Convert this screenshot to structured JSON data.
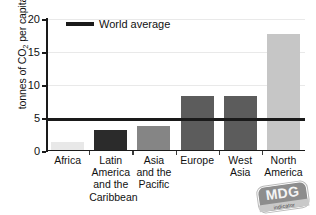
{
  "chart_data": {
    "type": "bar",
    "title": "",
    "xlabel": "",
    "ylabel": "tonnes of CO2 per capita",
    "ylabel_prefix": "tonnes of CO",
    "ylabel_subscript": "2",
    "ylabel_suffix": " per capita",
    "ylim": [
      0,
      20
    ],
    "yticks": [
      0,
      5,
      10,
      15,
      20
    ],
    "ytick_labels": [
      "0",
      "5",
      "10",
      "15",
      "20"
    ],
    "grid": true,
    "grid_axis": "y",
    "legend_position": "top-left-inside",
    "categories": [
      "Africa",
      "Latin America and the Caribbean",
      "Asia and the Pacific",
      "Europe",
      "West Asia",
      "North America"
    ],
    "category_label_lines": [
      [
        "Africa"
      ],
      [
        "Latin",
        "America",
        "and the",
        "Caribbean"
      ],
      [
        "Asia",
        "and the",
        "Pacific"
      ],
      [
        "Europe"
      ],
      [
        "West",
        "Asia"
      ],
      [
        "North",
        "America"
      ]
    ],
    "values": [
      1.2,
      3.0,
      3.5,
      8.1,
      8.1,
      17.5
    ],
    "bar_colors": [
      "#e8e8e8",
      "#2b2b2b",
      "#858585",
      "#5c5c5c",
      "#5c5c5c",
      "#c6c6c6"
    ],
    "annotations": [
      {
        "name": "world-average",
        "label": "World average",
        "value": 4.8,
        "type": "hline",
        "color": "#1a1a1a"
      }
    ],
    "legend": [
      {
        "label": "World average",
        "color": "#1a1a1a",
        "marker": "line"
      }
    ]
  },
  "legend": {
    "world_average_label": "World average"
  },
  "logo": {
    "name": "mdg-indicator-logo",
    "main_text": "MDG",
    "sub_text": "indicator"
  }
}
